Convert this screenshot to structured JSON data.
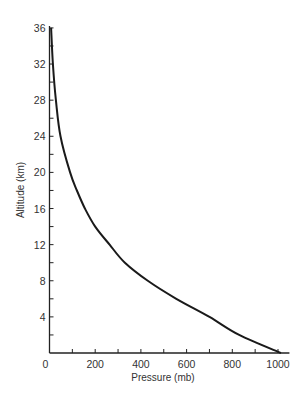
{
  "chart_data": {
    "type": "line",
    "title": "",
    "xlabel": "Pressure (mb)",
    "ylabel": "Altitude (km)",
    "xlim": [
      0,
      1050
    ],
    "ylim": [
      0,
      36
    ],
    "grid": false,
    "legend": null,
    "x_ticks": [
      0,
      200,
      400,
      600,
      800,
      1000
    ],
    "x_minor_ticks": [
      100,
      300,
      500,
      700,
      900
    ],
    "y_ticks": [
      4,
      8,
      12,
      16,
      20,
      24,
      28,
      32,
      36
    ],
    "y_minor_ticks": [
      2,
      6,
      10,
      14,
      18,
      22,
      26,
      30,
      34
    ],
    "x_tick_labels": [
      "0",
      "200",
      "400",
      "600",
      "800",
      "1000"
    ],
    "y_tick_labels": [
      "4",
      "8",
      "12",
      "16",
      "20",
      "24",
      "28",
      "32",
      "36"
    ],
    "series": [
      {
        "name": "Pressure vs Altitude",
        "color": "#1a1a1a",
        "points": [
          {
            "altitude": 0,
            "pressure": 1013
          },
          {
            "altitude": 2,
            "pressure": 830
          },
          {
            "altitude": 4,
            "pressure": 700
          },
          {
            "altitude": 6,
            "pressure": 555
          },
          {
            "altitude": 8,
            "pressure": 430
          },
          {
            "altitude": 10,
            "pressure": 330
          },
          {
            "altitude": 12,
            "pressure": 263
          },
          {
            "altitude": 14,
            "pressure": 200
          },
          {
            "altitude": 16,
            "pressure": 155
          },
          {
            "altitude": 18,
            "pressure": 120
          },
          {
            "altitude": 20,
            "pressure": 90
          },
          {
            "altitude": 24,
            "pressure": 48
          },
          {
            "altitude": 28,
            "pressure": 28
          },
          {
            "altitude": 32,
            "pressure": 15
          },
          {
            "altitude": 36,
            "pressure": 7
          }
        ]
      }
    ]
  },
  "layout": {
    "origin_x": 49.5,
    "origin_y": 353,
    "px_per_mb": 0.2285,
    "px_per_km": 9.03,
    "axis_color": "#222222",
    "curve_color": "#1a1a1a"
  }
}
